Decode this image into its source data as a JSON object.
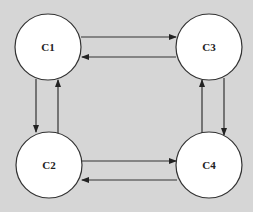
{
  "diagram": {
    "type": "state-transition",
    "colors": {
      "background": "#d6d6d6",
      "node_fill": "#ffffff",
      "stroke": "#333333"
    },
    "nodes": [
      {
        "id": "C1",
        "label": "C1"
      },
      {
        "id": "C2",
        "label": "C2"
      },
      {
        "id": "C3",
        "label": "C3"
      },
      {
        "id": "C4",
        "label": "C4"
      }
    ],
    "edges": [
      {
        "from": "C1",
        "to": "C3"
      },
      {
        "from": "C3",
        "to": "C1"
      },
      {
        "from": "C1",
        "to": "C2"
      },
      {
        "from": "C2",
        "to": "C1"
      },
      {
        "from": "C2",
        "to": "C4"
      },
      {
        "from": "C4",
        "to": "C2"
      },
      {
        "from": "C3",
        "to": "C4"
      },
      {
        "from": "C4",
        "to": "C3"
      }
    ]
  }
}
